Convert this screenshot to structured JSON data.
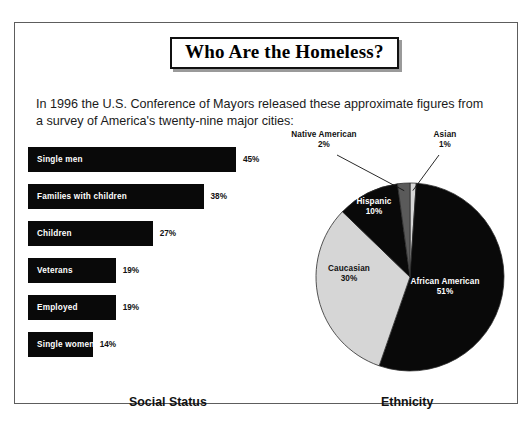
{
  "document": {
    "headline": "Who Are the Homeless?",
    "intro": "In 1996 the U.S. Conference of Mayors released these approximate figures from a survey of America's twenty-nine major cities:"
  },
  "chart_data": [
    {
      "type": "bar",
      "title": "Social Status",
      "orientation": "horizontal",
      "xlabel": "",
      "ylabel": "",
      "xlim": [
        0,
        50
      ],
      "grid": false,
      "legend": "none",
      "categories": [
        "Single men",
        "Families with children",
        "Children",
        "Veterans",
        "Employed",
        "Single women"
      ],
      "values": [
        45,
        38,
        27,
        19,
        19,
        14
      ],
      "value_labels": [
        "45%",
        "38%",
        "27%",
        "19%",
        "19%",
        "14%"
      ],
      "bar_color": "#090909",
      "label_color": "#ffffff"
    },
    {
      "type": "pie",
      "title": "Ethnicity",
      "legend": "none",
      "start_angle_deg": 0,
      "direction": "clockwise",
      "slices": [
        {
          "name": "Asian",
          "value": 1,
          "label": "Asian",
          "value_label": "1%",
          "color": "#d6d6d6",
          "label_placement": "outside",
          "label_tone": "outside"
        },
        {
          "name": "African American",
          "value": 51,
          "label": "African American",
          "value_label": "51%",
          "color": "#090909",
          "label_placement": "inside",
          "label_tone": "on-dark"
        },
        {
          "name": "Caucasian",
          "value": 30,
          "label": "Caucasian",
          "value_label": "30%",
          "color": "#d6d6d6",
          "label_placement": "inside",
          "label_tone": "on-light"
        },
        {
          "name": "Hispanic",
          "value": 10,
          "label": "Hispanic",
          "value_label": "10%",
          "color": "#090909",
          "label_placement": "inside",
          "label_tone": "on-dark"
        },
        {
          "name": "Native American",
          "value": 2,
          "label": "Native American",
          "value_label": "2%",
          "color": "#5a5a5a",
          "label_placement": "outside",
          "label_tone": "outside"
        }
      ]
    }
  ],
  "captions": {
    "social_status": "Social Status",
    "ethnicity": "Ethnicity"
  },
  "colors": {
    "frame": "#5d5d5d",
    "ink": "#111111",
    "bar_fill": "#090909",
    "pie_dark": "#090909",
    "pie_light": "#d6d6d6",
    "pie_mid": "#5a5a5a",
    "paper": "#ffffff"
  }
}
